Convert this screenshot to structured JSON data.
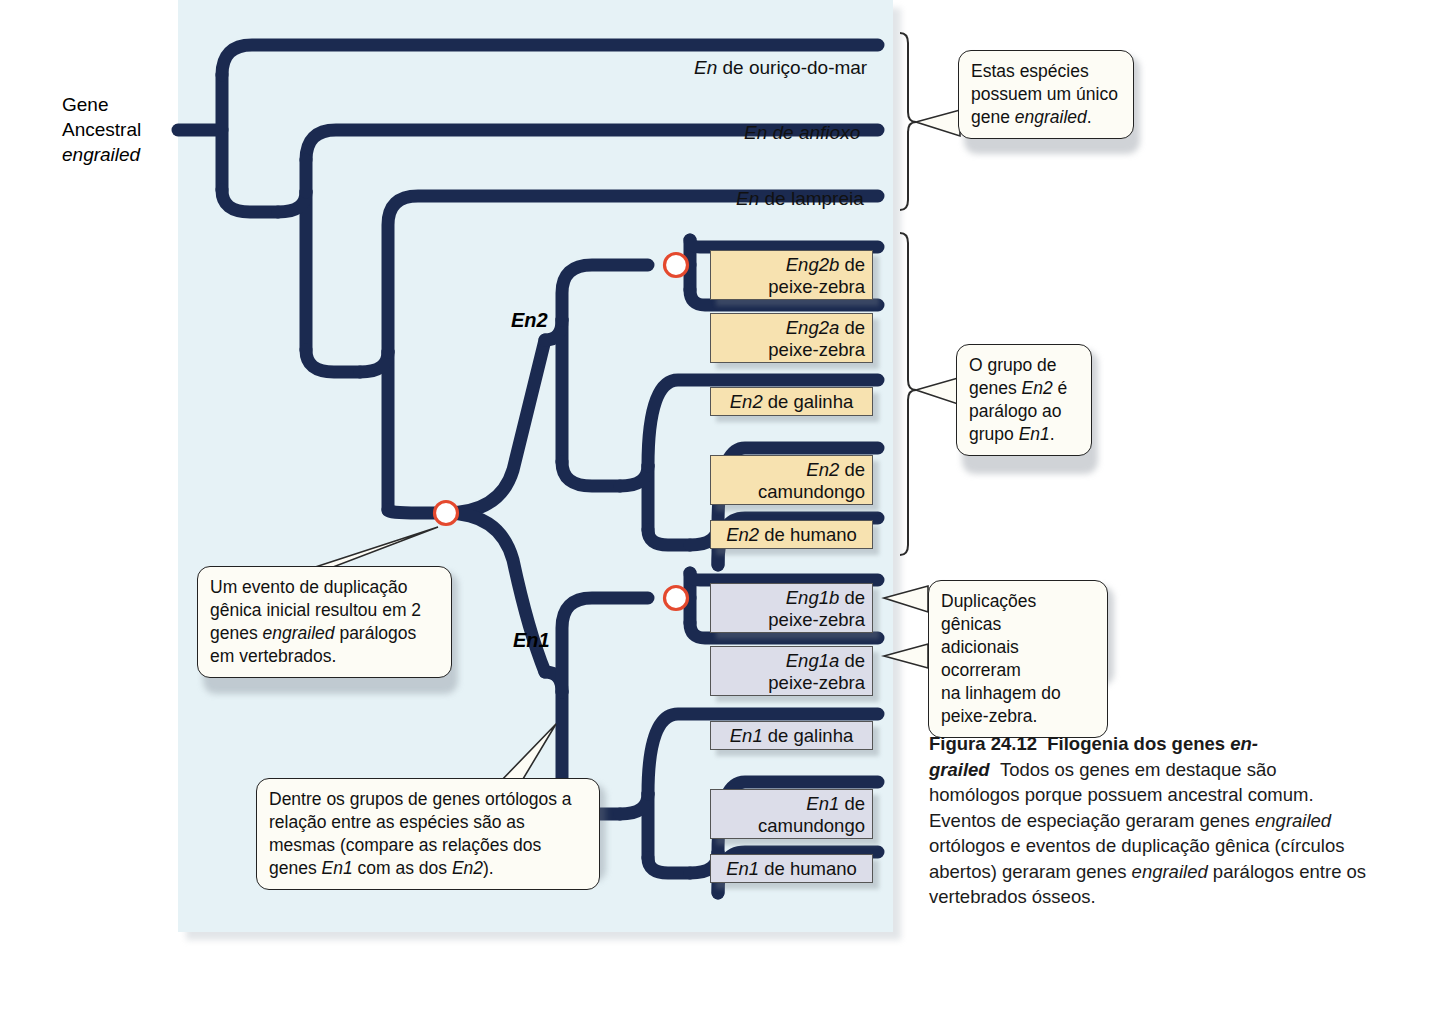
{
  "figure": {
    "panel_bg": "#e6f2f6",
    "branch_color": "#1b2a50",
    "dup_node_ring": "#e4492e",
    "en2_box_fill": "#f7e2b0",
    "en1_box_fill": "#dcdde9"
  },
  "root_label": {
    "line1": "Gene",
    "line2": "Ancestral",
    "line3": "engrailed"
  },
  "node_labels": {
    "en2": "En2",
    "en1": "En1"
  },
  "tips": [
    {
      "id": "sea-urchin",
      "prefix": "En",
      "rest": " de ouriço-do-mar",
      "plain": "En de ouriço-do-mar"
    },
    {
      "id": "amphioxus",
      "prefix": "En",
      "rest": " de anfioxo",
      "plain": "En de anfioxo"
    },
    {
      "id": "lamprey",
      "prefix": "En",
      "rest": " de lampreia",
      "plain": "En de lampreia"
    }
  ],
  "en2_genes": [
    {
      "id": "eng2b-zebrafish",
      "line1_ital": "Eng2b",
      "line1_rest": " de",
      "line2": "peixe-zebra"
    },
    {
      "id": "eng2a-zebrafish",
      "line1_ital": "Eng2a",
      "line1_rest": " de",
      "line2": "peixe-zebra"
    },
    {
      "id": "en2-chicken",
      "line1_ital": "En2",
      "line1_rest": " de galinha",
      "line2": ""
    },
    {
      "id": "en2-mouse",
      "line1_ital": "En2",
      "line1_rest": " de",
      "line2": "camundongo"
    },
    {
      "id": "en2-human",
      "line1_ital": "En2",
      "line1_rest": " de humano",
      "line2": ""
    }
  ],
  "en1_genes": [
    {
      "id": "eng1b-zebrafish",
      "line1_ital": "Eng1b",
      "line1_rest": " de",
      "line2": "peixe-zebra"
    },
    {
      "id": "eng1a-zebrafish",
      "line1_ital": "Eng1a",
      "line1_rest": " de",
      "line2": "peixe-zebra"
    },
    {
      "id": "en1-chicken",
      "line1_ital": "En1",
      "line1_rest": " de galinha",
      "line2": ""
    },
    {
      "id": "en1-mouse",
      "line1_ital": "En1",
      "line1_rest": " de",
      "line2": "camundongo"
    },
    {
      "id": "en1-human",
      "line1_ital": "En1",
      "line1_rest": " de humano",
      "line2": ""
    }
  ],
  "callouts": {
    "single_gene": {
      "line1": "Estas espécies",
      "line2": "possuem um único",
      "line3_pre": "gene ",
      "line3_ital": "engrailed",
      "line3_post": "."
    },
    "paralog_group": {
      "line1": "O grupo de",
      "line2_pre": "genes ",
      "line2_ital": "En2",
      "line2_post": " é",
      "line3": "parálogo ao",
      "line4_pre": "grupo ",
      "line4_ital": "En1",
      "line4_post": "."
    },
    "duplication_event": {
      "line1": "Um evento de duplicação",
      "line2": "gênica inicial resultou em 2",
      "line3_pre": "genes ",
      "line3_ital": "engrailed",
      "line3_post": " parálogos",
      "line4": "em vertebrados."
    },
    "extra_duplications": {
      "line1": "Duplicações gênicas",
      "line2": "adicionais ocorreram",
      "line3": "na linhagem do",
      "line4": "peixe-zebra."
    },
    "ortholog_groups": {
      "line1": "Dentre os grupos de genes ortólogos a",
      "line2": "relação entre as espécies são as",
      "line3": "mesmas (compare as relações dos",
      "line4_pre": "genes ",
      "line4_ital1": "En1",
      "line4_mid": " com as dos  ",
      "line4_ital2": "En2",
      "line4_post": ")."
    }
  },
  "caption": {
    "figure_number": "Figura 24.12",
    "title_bold": "Filogenia dos genes ",
    "title_bold_italic": "en-grailed",
    "body_1": "Todos os genes em destaque são homólogos porque possuem ancestral comum. Eventos de especiação geraram genes ",
    "body_ital_1": "engrailed",
    "body_2": " ortólogos e eventos de duplicação gênica (círculos abertos) geraram genes ",
    "body_ital_2": "engrailed",
    "body_3": " parálogos entre os vertebrados ósseos."
  }
}
